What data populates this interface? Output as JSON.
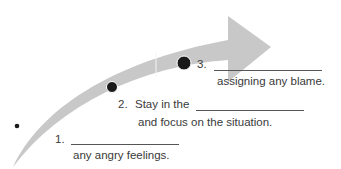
{
  "diagram": {
    "type": "curved-arrow-steps",
    "colors": {
      "arrow_fill": "#c8c8c8",
      "divider": "#f4f4f4",
      "dot": "#1a1a1a",
      "text": "#3a3a3a",
      "blank_line": "#555555"
    },
    "steps": [
      {
        "number": "1.",
        "line1_prefix": "",
        "line2": "any angry feelings."
      },
      {
        "number": "2.",
        "line1_prefix": "Stay in the",
        "line2": "and focus on the situation."
      },
      {
        "number": "3.",
        "line1_prefix": "",
        "line2": "assigning any blame."
      }
    ]
  }
}
